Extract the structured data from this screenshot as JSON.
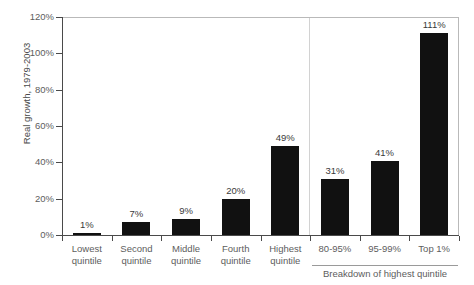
{
  "chart_data": {
    "type": "bar",
    "title": "",
    "xlabel": "",
    "ylabel": "Real growth, 1979-2003",
    "ylim": [
      0,
      120
    ],
    "grid": false,
    "legend": "none",
    "categories": [
      "Lowest quintile",
      "Second quintile",
      "Middle quintile",
      "Fourth quintile",
      "Highest quintile",
      "80-95%",
      "95-99%",
      "Top 1%"
    ],
    "values": [
      1,
      7,
      9,
      20,
      49,
      31,
      41,
      111
    ],
    "value_labels": [
      "1%",
      "7%",
      "9%",
      "20%",
      "49%",
      "31%",
      "41%",
      "111%"
    ],
    "ytick_labels": [
      "0%",
      "20%",
      "40%",
      "60%",
      "80%",
      "100%",
      "120%"
    ],
    "ytick_values": [
      0,
      20,
      40,
      60,
      80,
      100,
      120
    ],
    "annotations": [
      "Breakdown of highest quintile"
    ],
    "bar_color": "#111111"
  },
  "axis": {
    "y_title": "Real growth, 1979-2003",
    "ticks": [
      {
        "label": "120%",
        "value": 120
      },
      {
        "label": "100%",
        "value": 100
      },
      {
        "label": "80%",
        "value": 80
      },
      {
        "label": "60%",
        "value": 60
      },
      {
        "label": "40%",
        "value": 40
      },
      {
        "label": "20%",
        "value": 20
      },
      {
        "label": "0%",
        "value": 0
      }
    ]
  },
  "bars": [
    {
      "label_line1": "Lowest",
      "label_line2": "quintile",
      "value_label": "1%",
      "value": 1
    },
    {
      "label_line1": "Second",
      "label_line2": "quintile",
      "value_label": "7%",
      "value": 7
    },
    {
      "label_line1": "Middle",
      "label_line2": "quintile",
      "value_label": "9%",
      "value": 9
    },
    {
      "label_line1": "Fourth",
      "label_line2": "quintile",
      "value_label": "20%",
      "value": 20
    },
    {
      "label_line1": "Highest",
      "label_line2": "quintile",
      "value_label": "49%",
      "value": 49
    },
    {
      "label_line1": "80-95%",
      "label_line2": "",
      "value_label": "31%",
      "value": 31
    },
    {
      "label_line1": "95-99%",
      "label_line2": "",
      "value_label": "41%",
      "value": 41
    },
    {
      "label_line1": "Top 1%",
      "label_line2": "",
      "value_label": "111%",
      "value": 111
    }
  ],
  "breakdown": {
    "caption": "Breakdown of highest quintile"
  }
}
